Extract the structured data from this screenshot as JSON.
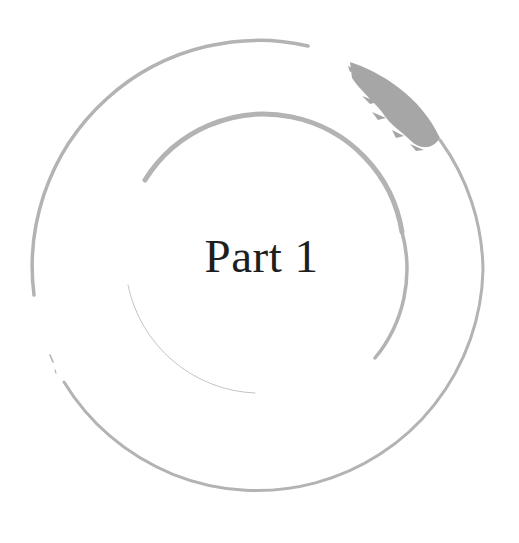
{
  "page": {
    "title": "Part 1",
    "background_color": "#ffffff",
    "text_color": "#1e1e1e",
    "ornament_color": "#b3b3b3",
    "ornament_dark_color": "#a6a6a6"
  },
  "ornaments": [
    {
      "name": "outer-brush-circle",
      "description": "large enso brush circle"
    },
    {
      "name": "inner-brush-arc",
      "description": "inner partial brush arc"
    },
    {
      "name": "inner-thin-tail",
      "description": "faint thin arc stroke lower-left"
    },
    {
      "name": "brush-splatter",
      "description": "heavy dry-brush texture at upper right"
    }
  ]
}
